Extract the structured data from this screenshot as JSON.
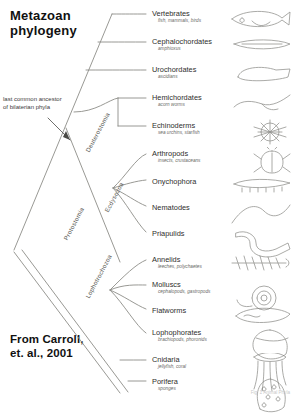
{
  "title": {
    "line1": "Metazoan",
    "line2": "phylogeny"
  },
  "credit": {
    "line1": "From Carroll,",
    "line2": "et. al., 2001"
  },
  "annotation": {
    "ancestor_note": "last common ancestor of bilaterian phyla"
  },
  "corner": {
    "mark": "Fig. 1  Animal Phyla"
  },
  "colors": {
    "ink": "#2e2e2c",
    "sub_ink": "#6a6a66",
    "branch": "#8d8d88",
    "clade_label": "#55554f",
    "background": "#ffffff"
  },
  "clade_labels": [
    {
      "id": "deuterostomia",
      "label": "Deuterostomia",
      "x": 84,
      "y": 150,
      "rotate": -62
    },
    {
      "id": "protostomia",
      "label": "Protostomia",
      "x": 62,
      "y": 238,
      "rotate": -62
    },
    {
      "id": "ecdysozoa",
      "label": "Ecdysozoa",
      "x": 103,
      "y": 210,
      "rotate": -62
    },
    {
      "id": "lophotrochozoa",
      "label": "Lophotrochozoa",
      "x": 84,
      "y": 296,
      "rotate": -62
    }
  ],
  "taxa": [
    {
      "id": "vertebrates",
      "name": "Vertebrates",
      "sub": "fish, mammals, birds",
      "x": 152,
      "y": 10,
      "tip_x": 146,
      "tip_y": 14,
      "art": "fish"
    },
    {
      "id": "cephalochordates",
      "name": "Cephalochordates",
      "sub": "amphioxus",
      "x": 152,
      "y": 38,
      "tip_x": 146,
      "tip_y": 42,
      "art": "lancelet"
    },
    {
      "id": "urochordates",
      "name": "Urochordates",
      "sub": "ascidians",
      "x": 152,
      "y": 66,
      "tip_x": 146,
      "tip_y": 70,
      "art": "tunicate"
    },
    {
      "id": "hemichordates",
      "name": "Hemichordates",
      "sub": "acorn worms",
      "x": 152,
      "y": 94,
      "tip_x": 146,
      "tip_y": 98,
      "art": "acornworm"
    },
    {
      "id": "echinoderms",
      "name": "Echinoderms",
      "sub": "sea urchins, starfish",
      "x": 152,
      "y": 122,
      "tip_x": 146,
      "tip_y": 126,
      "art": "urchin"
    },
    {
      "id": "arthropods",
      "name": "Arthropods",
      "sub": "insects, crustaceans",
      "x": 152,
      "y": 150,
      "tip_x": 146,
      "tip_y": 154,
      "art": "beetle"
    },
    {
      "id": "onychophora",
      "name": "Onychophora",
      "sub": "",
      "x": 152,
      "y": 178,
      "tip_x": 146,
      "tip_y": 180,
      "art": "velvetworm"
    },
    {
      "id": "nematodes",
      "name": "Nematodes",
      "sub": "",
      "x": 152,
      "y": 204,
      "tip_x": 146,
      "tip_y": 206,
      "art": "nematode"
    },
    {
      "id": "priapulids",
      "name": "Priapulids",
      "sub": "",
      "x": 152,
      "y": 230,
      "tip_x": 146,
      "tip_y": 232,
      "art": "priapulid"
    },
    {
      "id": "annelids",
      "name": "Annelids",
      "sub": "leeches, polychaetes",
      "x": 152,
      "y": 256,
      "tip_x": 146,
      "tip_y": 260,
      "art": "annelid"
    },
    {
      "id": "molluscs",
      "name": "Molluscs",
      "sub": "cephalopods, gastropods",
      "x": 152,
      "y": 281,
      "tip_x": 146,
      "tip_y": 285,
      "art": "snail"
    },
    {
      "id": "flatworms",
      "name": "Flatworms",
      "sub": "",
      "x": 152,
      "y": 307,
      "tip_x": 146,
      "tip_y": 309,
      "art": "flatworm"
    },
    {
      "id": "lophophorates",
      "name": "Lophophorates",
      "sub": "brachiopods, phoronids",
      "x": 152,
      "y": 329,
      "tip_x": 146,
      "tip_y": 333,
      "art": "brachiopod"
    },
    {
      "id": "cnidaria",
      "name": "Cnidaria",
      "sub": "jellyfish, coral",
      "x": 152,
      "y": 356,
      "tip_x": 146,
      "tip_y": 360,
      "art": "cnidarian"
    },
    {
      "id": "porifera",
      "name": "Porifera",
      "sub": "sponges",
      "x": 152,
      "y": 378,
      "tip_x": 146,
      "tip_y": 381,
      "art": "sponge"
    }
  ]
}
